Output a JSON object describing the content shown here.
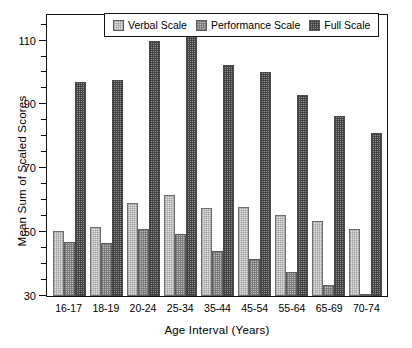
{
  "chart_data": {
    "type": "bar",
    "title": "",
    "xlabel": "Age Interval  (Years)",
    "ylabel": "Mean Sum of Scaled Scores",
    "categories": [
      "16-17",
      "18-19",
      "20-24",
      "25-34",
      "35-44",
      "45-54",
      "55-64",
      "65-69",
      "70-74"
    ],
    "ylim": [
      30,
      118
    ],
    "yticks": [
      30,
      50,
      70,
      90,
      110
    ],
    "ytick_labels": [
      "30",
      "50",
      "70",
      "90",
      "110"
    ],
    "minor_tick_step": 5,
    "grid": false,
    "legend_position": "top-center",
    "series": [
      {
        "name": "Verbal Scale",
        "color": "#e4e4e4",
        "values": [
          50.5,
          51.5,
          59.0,
          61.5,
          57.5,
          58.0,
          55.5,
          53.5,
          51.0
        ]
      },
      {
        "name": "Performance Scale",
        "color": "#bdbdbd",
        "values": [
          47.0,
          46.5,
          51.0,
          49.5,
          44.0,
          41.5,
          37.5,
          33.5,
          30.4
        ]
      },
      {
        "name": "Full Scale",
        "color": "#8f8f8f",
        "values": [
          97.0,
          97.5,
          110.0,
          112.5,
          102.5,
          100.0,
          93.0,
          86.5,
          81.0
        ]
      }
    ]
  },
  "legend": {
    "items": [
      {
        "label": "Verbal Scale",
        "swatch": "verbal-swatch"
      },
      {
        "label": "Performance Scale",
        "swatch": "performance-swatch"
      },
      {
        "label": "Full Scale",
        "swatch": "full-swatch"
      }
    ]
  },
  "axes": {
    "y_title": "Mean Sum of Scaled Scores",
    "x_title": "Age Interval  (Years)"
  }
}
